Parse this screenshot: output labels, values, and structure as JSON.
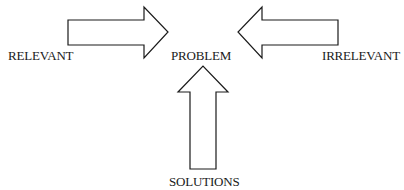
{
  "diagram": {
    "center": {
      "label": "PROBLEM"
    },
    "left": {
      "label": "RELEVANT",
      "arrow_direction": "right"
    },
    "right": {
      "label": "IRRELEVANT",
      "arrow_direction": "left"
    },
    "bottom": {
      "label": "SOLUTIONS",
      "arrow_direction": "up"
    },
    "stroke_color": "#1a1a1a",
    "fill_color": "#ffffff"
  }
}
